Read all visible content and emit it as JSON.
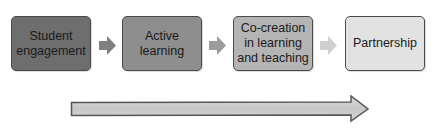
{
  "diagram": {
    "type": "process-flow",
    "steps": [
      {
        "label": "Student engagement",
        "lines": [
          "Student",
          "engagement"
        ],
        "fill": "#6e6e6e"
      },
      {
        "label": "Active learning",
        "lines": [
          "Active",
          "learning"
        ],
        "fill": "#8e8e8e"
      },
      {
        "label": "Co-creation in learning and teaching",
        "lines": [
          "Co-creation",
          "in learning",
          "and teaching"
        ],
        "fill": "#b4b4b4"
      },
      {
        "label": "Partnership",
        "lines": [
          "Partnership"
        ],
        "fill": "#e2e2e2"
      }
    ],
    "connector_arrows": [
      {
        "from": "Student engagement",
        "to": "Active learning",
        "fill": "#808080"
      },
      {
        "from": "Active learning",
        "to": "Co-creation in learning and teaching",
        "fill": "#9c9c9c"
      },
      {
        "from": "Co-creation in learning and teaching",
        "to": "Partnership",
        "fill": "#cfcfcf"
      }
    ],
    "progression_arrow": {
      "direction": "right",
      "fill": "#cdcdcd",
      "stroke": "#555555"
    },
    "colors": {
      "box_border": "#4a4a4a",
      "text": "#1a1a1a",
      "background": "#ffffff"
    }
  }
}
